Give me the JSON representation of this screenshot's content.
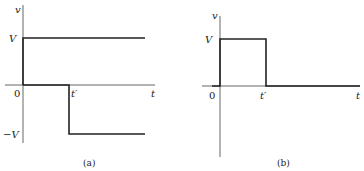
{
  "panels": [
    {
      "id": "a",
      "caption": "(a)",
      "y_axis_label": "v",
      "x_axis_label": "t",
      "origin_label": "0",
      "high_level_label": "V",
      "low_level_label": "−V",
      "step_time_label": "t′",
      "description": "Signal equals V from 0 to t', then steps to −V and stays."
    },
    {
      "id": "b",
      "caption": "(b)",
      "y_axis_label": "v",
      "x_axis_label": "t",
      "origin_label": "0",
      "high_level_label": "V",
      "step_time_label": "t′",
      "description": "Rectangular pulse of height V from 0 to t', zero afterwards."
    }
  ],
  "colors": {
    "line": "#222222",
    "axis": "#555555"
  }
}
